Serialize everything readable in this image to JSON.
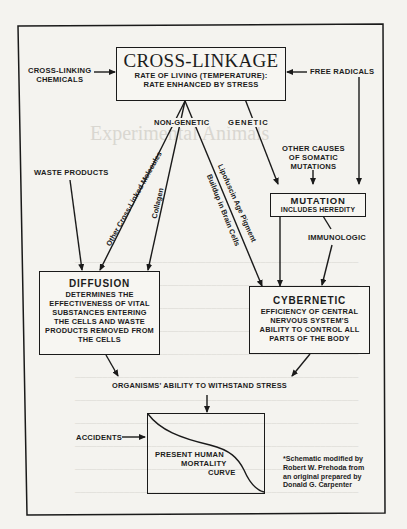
{
  "diagram": {
    "cross_linkage": {
      "title": "CROSS-LINKAGE",
      "line1": "RATE OF LIVING (TEMPERATURE):",
      "line2": "RATE ENHANCED BY STRESS"
    },
    "inputs": {
      "cross_linking_chemicals": [
        "CROSS-LINKING",
        "CHEMICALS"
      ],
      "free_radicals": "FREE RADICALS",
      "waste_products": "WASTE PRODUCTS",
      "other_causes": [
        "OTHER CAUSES",
        "OF SOMATIC",
        "MUTATIONS"
      ],
      "accidents": "ACCIDENTS"
    },
    "branch_labels": {
      "non_genetic": "NON-GENETIC",
      "genetic": "GENETIC",
      "other_cross_linked": "Other Cross-Linked Molecules",
      "collagen": "Collagen",
      "lipofuscin": "Lipofuscin Age Pigment",
      "buildup": "Buildup in Brain Cells",
      "immunologic": "IMMUNOLOGIC"
    },
    "mutation": {
      "title": "MUTATION",
      "body": "INCLUDES HEREDITY"
    },
    "diffusion": {
      "title": "DIFFUSION",
      "lines": [
        "DETERMINES THE",
        "EFFECTIVENESS OF VITAL",
        "SUBSTANCES ENTERING",
        "THE CELLS AND WASTE",
        "PRODUCTS REMOVED FROM",
        "THE CELLS"
      ]
    },
    "cybernetic": {
      "title": "CYBERNETIC",
      "lines": [
        "EFFICIENCY OF CENTRAL",
        "NERVOUS SYSTEM'S",
        "ABILITY TO CONTROL ALL",
        "PARTS OF THE BODY"
      ]
    },
    "stress": "ORGANISMS' ABILITY TO WITHSTAND STRESS",
    "mortality": {
      "lines": [
        "PRESENT HUMAN",
        "MORTALITY",
        "CURVE"
      ]
    },
    "credit": [
      "*Schematic modified by",
      "Robert W. Prehoda from",
      "an original prepared by",
      "Donald G. Carpenter"
    ]
  },
  "background_showthrough": {
    "title": "Experimental Animals",
    "heading": "Experimental Animals"
  }
}
